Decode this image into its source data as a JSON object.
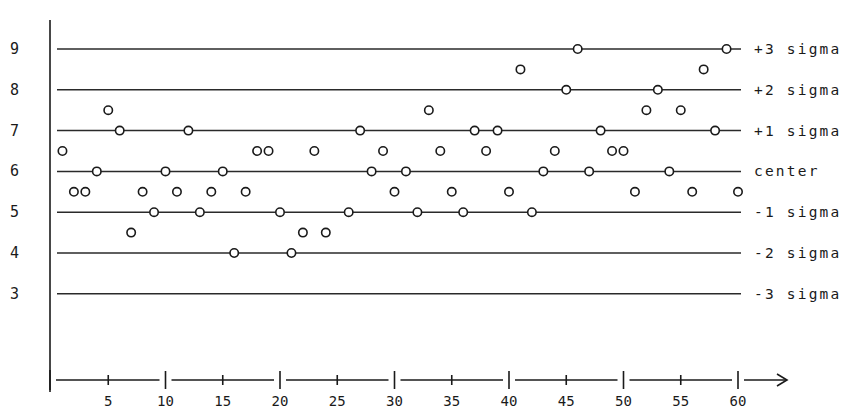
{
  "chart_data": {
    "type": "scatter",
    "subtype": "control-chart",
    "title": "",
    "xlabel": "",
    "ylabel": "",
    "xlim": [
      0,
      60
    ],
    "ylim": [
      3,
      9
    ],
    "x_ticks": {
      "major": [
        10,
        20,
        30,
        40,
        50,
        60
      ],
      "minor": [
        5,
        15,
        25,
        35,
        45,
        55
      ],
      "labels": [
        "5",
        "10",
        "15",
        "20",
        "25",
        "30",
        "35",
        "40",
        "45",
        "50",
        "55",
        "60"
      ],
      "arrow": "--->"
    },
    "y_ticks": [
      "3",
      "4",
      "5",
      "6",
      "7",
      "8",
      "9"
    ],
    "grid": false,
    "reference_lines": [
      {
        "y": 9,
        "label": "+3 sigma"
      },
      {
        "y": 8,
        "label": "+2 sigma"
      },
      {
        "y": 7,
        "label": "+1 sigma"
      },
      {
        "y": 6,
        "label": "center"
      },
      {
        "y": 5,
        "label": "-1 sigma"
      },
      {
        "y": 4,
        "label": "-2 sigma"
      },
      {
        "y": 3,
        "label": "-3 sigma"
      }
    ],
    "series": [
      {
        "name": "observations",
        "marker": "open-circle",
        "x": [
          1,
          2,
          3,
          4,
          5,
          6,
          7,
          8,
          9,
          10,
          11,
          12,
          13,
          14,
          15,
          16,
          17,
          18,
          19,
          20,
          21,
          22,
          23,
          24,
          26,
          27,
          28,
          29,
          30,
          31,
          32,
          33,
          34,
          35,
          36,
          37,
          38,
          39,
          40,
          41,
          42,
          43,
          44,
          45,
          46,
          47,
          48,
          49,
          50,
          51,
          52,
          53,
          54,
          55,
          56,
          57,
          58,
          59,
          60
        ],
        "y": [
          6.5,
          5.5,
          5.5,
          6.0,
          7.5,
          7.0,
          4.5,
          5.5,
          5.0,
          6.0,
          5.5,
          7.0,
          5.0,
          5.5,
          6.0,
          4.0,
          5.5,
          6.5,
          6.5,
          5.0,
          4.0,
          4.5,
          6.5,
          4.5,
          5.0,
          7.0,
          6.0,
          6.5,
          5.5,
          6.0,
          5.0,
          7.5,
          6.5,
          5.5,
          5.0,
          7.0,
          6.5,
          7.0,
          5.5,
          8.5,
          5.0,
          6.0,
          6.5,
          8.0,
          9.0,
          6.0,
          7.0,
          6.5,
          6.5,
          5.5,
          7.5,
          8.0,
          6.0,
          7.5,
          5.5,
          8.5,
          7.0,
          9.0,
          5.5
        ]
      }
    ]
  },
  "colors": {
    "ink": "#1a1a1a",
    "background": "#ffffff"
  }
}
